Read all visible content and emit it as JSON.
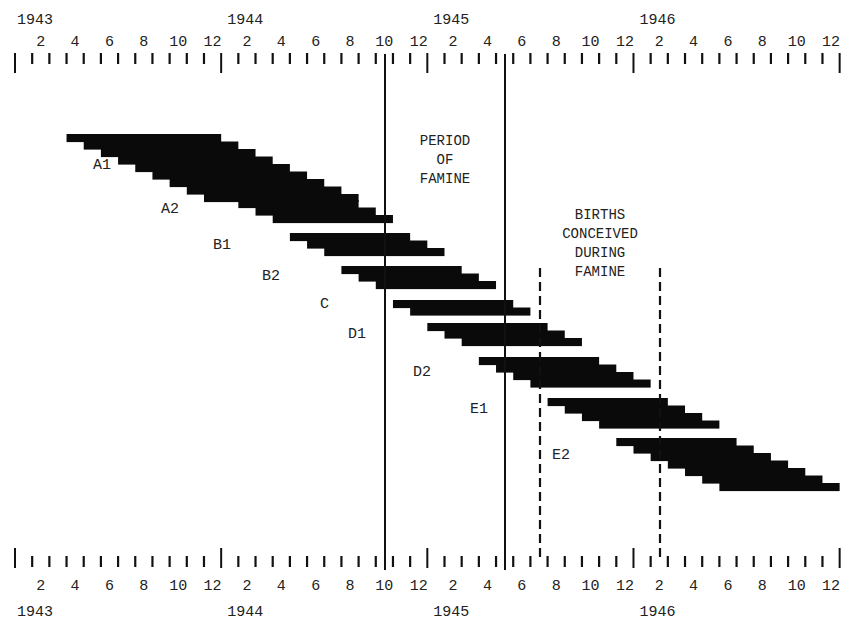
{
  "chart_data": {
    "type": "bar",
    "subtype": "timeline-gantt-staircase",
    "title": "",
    "xlabel": "",
    "ylabel": "",
    "x_axis": {
      "start": "1943-01",
      "end": "1946-12",
      "years": [
        "1943",
        "1944",
        "1945",
        "1946"
      ],
      "month_tick_labels": [
        "2",
        "4",
        "6",
        "8",
        "10",
        "12"
      ],
      "axes_positions": [
        "top",
        "bottom"
      ]
    },
    "annotations": [
      {
        "text": "PERIOD\nOF\nFAMINE",
        "type": "solid-lines",
        "from": "1944-10",
        "to": "1945-05"
      },
      {
        "text": "BIRTHS\nCONCEIVED\nDURING\nFAMINE",
        "type": "dashed-lines",
        "from": "1945-07",
        "to": "1946-02"
      }
    ],
    "series": [
      {
        "name": "A1",
        "steps": [
          [
            "1943-04",
            "1944-01"
          ],
          [
            "1943-05",
            "1944-02"
          ],
          [
            "1943-06",
            "1944-03"
          ],
          [
            "1943-07",
            "1944-04"
          ],
          [
            "1943-08",
            "1944-05"
          ],
          [
            "1943-09",
            "1944-06"
          ],
          [
            "1943-10",
            "1944-07"
          ],
          [
            "1943-11",
            "1944-08"
          ],
          [
            "1943-12",
            "1944-09"
          ]
        ]
      },
      {
        "name": "A2",
        "steps": [
          [
            "1944-02",
            "1944-09"
          ],
          [
            "1944-03",
            "1944-10"
          ],
          [
            "1944-04",
            "1944-11"
          ]
        ]
      },
      {
        "name": "B1",
        "steps": [
          [
            "1944-05",
            "1944-12"
          ],
          [
            "1944-06",
            "1945-01"
          ],
          [
            "1944-07",
            "1945-02"
          ]
        ]
      },
      {
        "name": "B2",
        "steps": [
          [
            "1944-08",
            "1945-03"
          ],
          [
            "1944-09",
            "1945-04"
          ],
          [
            "1944-10",
            "1945-05"
          ]
        ]
      },
      {
        "name": "C",
        "steps": [
          [
            "1944-11",
            "1945-06"
          ],
          [
            "1944-12",
            "1945-07"
          ]
        ]
      },
      {
        "name": "D1",
        "steps": [
          [
            "1945-01",
            "1945-08"
          ],
          [
            "1945-02",
            "1945-09"
          ],
          [
            "1945-03",
            "1945-10"
          ]
        ]
      },
      {
        "name": "D2",
        "steps": [
          [
            "1945-04",
            "1945-11"
          ],
          [
            "1945-05",
            "1945-12"
          ],
          [
            "1945-06",
            "1946-01"
          ],
          [
            "1945-07",
            "1946-02"
          ]
        ]
      },
      {
        "name": "E1",
        "steps": [
          [
            "1945-08",
            "1946-03"
          ],
          [
            "1945-09",
            "1946-04"
          ],
          [
            "1945-10",
            "1946-05"
          ],
          [
            "1945-11",
            "1946-06"
          ]
        ]
      },
      {
        "name": "E2",
        "steps": [
          [
            "1945-12",
            "1946-07"
          ],
          [
            "1946-01",
            "1946-08"
          ],
          [
            "1946-02",
            "1946-09"
          ],
          [
            "1946-03",
            "1946-10"
          ],
          [
            "1946-04",
            "1946-11"
          ],
          [
            "1946-05",
            "1946-12"
          ],
          [
            "1946-06",
            "1947-01"
          ]
        ]
      }
    ]
  },
  "layout": {
    "x0": 15,
    "px_per_month": 17.18,
    "top_axis_y": 62,
    "bottom_axis_y": 568,
    "bar_step_height": 7.5,
    "bars": [
      {
        "name": "A1",
        "top": 134,
        "label_x": 93,
        "label_y": 166
      },
      {
        "name": "A2",
        "top": 200,
        "label_x": 161,
        "label_y": 210
      },
      {
        "name": "B1",
        "top": 233,
        "label_x": 213,
        "label_y": 246
      },
      {
        "name": "B2",
        "top": 266,
        "label_x": 262,
        "label_y": 277
      },
      {
        "name": "C",
        "top": 300,
        "label_x": 320,
        "label_y": 305
      },
      {
        "name": "D1",
        "top": 323,
        "label_x": 348,
        "label_y": 335
      },
      {
        "name": "D2",
        "top": 357,
        "label_x": 413,
        "label_y": 373
      },
      {
        "name": "E1",
        "top": 398,
        "label_x": 470,
        "label_y": 410
      },
      {
        "name": "E2",
        "top": 438,
        "label_x": 552,
        "label_y": 456
      }
    ],
    "famine_lines_x": [
      385,
      505
    ],
    "conception_lines_x": [
      540,
      660
    ],
    "annotation_positions": [
      {
        "left": 395,
        "top": 132,
        "width": 100
      },
      {
        "left": 535,
        "top": 206,
        "width": 130
      }
    ]
  },
  "labels": {
    "period_of_famine": "PERIOD\nOF\nFAMINE",
    "births_conceived": "BIRTHS\nCONCEIVED\nDURING\nFAMINE"
  }
}
